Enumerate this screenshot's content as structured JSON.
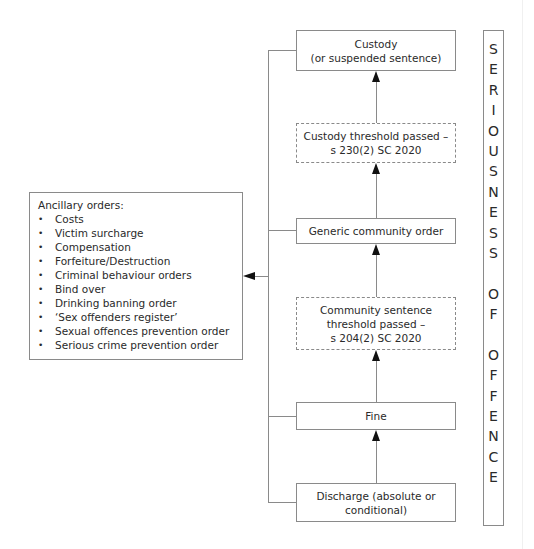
{
  "diagram": {
    "ladder": [
      {
        "id": "custody",
        "lines": [
          "Custody",
          "(or suspended sentence)"
        ],
        "style": "solid"
      },
      {
        "id": "custody-threshold",
        "lines": [
          "Custody threshold passed –",
          "s 230(2) SC 2020"
        ],
        "style": "dashed"
      },
      {
        "id": "generic-community-order",
        "lines": [
          "Generic community order"
        ],
        "style": "solid"
      },
      {
        "id": "community-threshold",
        "lines": [
          "Community sentence",
          "threshold passed –",
          "s 204(2) SC 2020"
        ],
        "style": "dashed"
      },
      {
        "id": "fine",
        "lines": [
          "Fine"
        ],
        "style": "solid"
      },
      {
        "id": "discharge",
        "lines": [
          "Discharge (absolute or",
          "conditional)"
        ],
        "style": "solid"
      }
    ],
    "ancillary": {
      "title": "Ancillary orders:",
      "items": [
        "Costs",
        "Victim surcharge",
        "Compensation",
        "Forfeiture/Destruction",
        "Criminal behaviour orders",
        "Bind over",
        "Drinking banning order",
        "‘Sex offenders register’",
        "Sexual offences prevention order",
        "Serious crime prevention order"
      ]
    },
    "side_label": {
      "letters": [
        "S",
        "E",
        "R",
        "I",
        "O",
        "U",
        "S",
        "N",
        "E",
        "S",
        "S",
        "",
        "O",
        "F",
        "",
        "O",
        "F",
        "F",
        "E",
        "N",
        "C",
        "E"
      ],
      "text": "SERIOUSNESS OF OFFENCE"
    },
    "colors": {
      "line": "#8a8a8a",
      "arrow": "#111111",
      "text": "#2a2a2a"
    }
  }
}
